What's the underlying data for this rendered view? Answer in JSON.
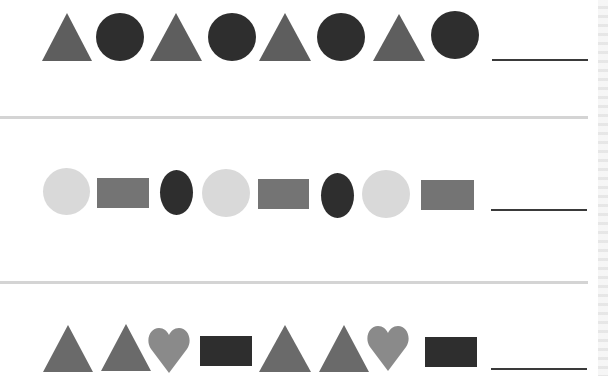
{
  "worksheet": {
    "colors": {
      "triangle": "#5e5e5e",
      "dark": "#2e2e2e",
      "light_circle": "#d9d9d9",
      "gray_rect": "#747474",
      "heart": "#8a8a8a",
      "divider": "#d4d4d4",
      "blank_line": "#3a3a3a"
    },
    "rows": [
      {
        "pattern": [
          "triangle",
          "circle",
          "triangle",
          "circle",
          "triangle",
          "circle",
          "triangle",
          "circle"
        ],
        "answer_blank": ""
      },
      {
        "pattern": [
          "light-circle",
          "rectangle",
          "dark-oval",
          "light-circle",
          "rectangle",
          "dark-oval",
          "light-circle",
          "rectangle"
        ],
        "answer_blank": ""
      },
      {
        "pattern": [
          "triangle",
          "triangle",
          "heart",
          "dark-rectangle",
          "triangle",
          "triangle",
          "heart",
          "dark-rectangle"
        ],
        "answer_blank": ""
      }
    ]
  }
}
